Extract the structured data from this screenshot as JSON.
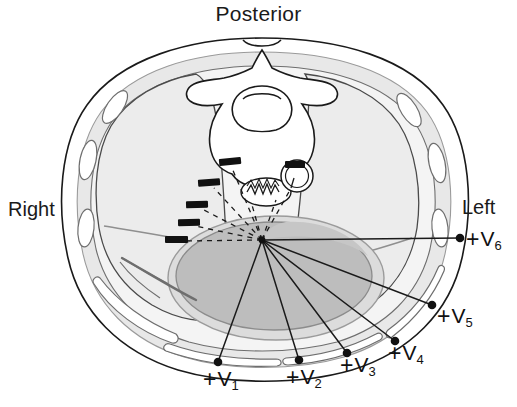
{
  "figure": {
    "kind": "thoracic-cross-section-ecg-precordial-leads",
    "orientation_labels": {
      "top": "Posterior",
      "left": "Right",
      "right": "Left"
    },
    "colors": {
      "outline": "#1a1a1a",
      "soft_tissue_gray": "#cfcfcf",
      "lung_field": "#f2f2f2",
      "heart_fill": "#b9b9b9",
      "pericardium": "#d8d8d8",
      "electrode_dot": "#111111",
      "lead_line": "#1a1a1a",
      "negative_marker": "#111111",
      "text": "#1a1a1a",
      "background": "#ffffff"
    },
    "heart_center": {
      "x": 262,
      "y": 240
    },
    "positive_electrodes": [
      {
        "id": "V1",
        "plus": "+",
        "name": "V",
        "sub": "1",
        "dot_x": 218,
        "dot_y": 362,
        "label_x": 203,
        "label_y": 366
      },
      {
        "id": "V2",
        "plus": "+",
        "name": "V",
        "sub": "2",
        "dot_x": 299,
        "dot_y": 360,
        "label_x": 286,
        "label_y": 364
      },
      {
        "id": "V3",
        "plus": "+",
        "name": "V",
        "sub": "3",
        "dot_x": 347,
        "dot_y": 353,
        "label_x": 340,
        "label_y": 352
      },
      {
        "id": "V4",
        "plus": "+",
        "name": "V",
        "sub": "4",
        "dot_x": 395,
        "dot_y": 341,
        "label_x": 388,
        "label_y": 340
      },
      {
        "id": "V5",
        "plus": "+",
        "name": "V",
        "sub": "5",
        "dot_x": 432,
        "dot_y": 305,
        "label_x": 437,
        "label_y": 305
      },
      {
        "id": "V6",
        "plus": "+",
        "name": "V",
        "sub": "6",
        "dot_x": 460,
        "dot_y": 238,
        "label_x": 466,
        "label_y": 226
      }
    ],
    "negative_markers": [
      {
        "x": 228,
        "y": 163,
        "angle": -6
      },
      {
        "x": 208,
        "y": 183,
        "angle": -4
      },
      {
        "x": 196,
        "y": 205,
        "angle": -2
      },
      {
        "x": 189,
        "y": 222,
        "angle": -1
      },
      {
        "x": 176,
        "y": 240,
        "angle": 0
      },
      {
        "x": 293,
        "y": 165,
        "angle": 0
      }
    ],
    "anatomy_labels": {
      "vertebra": "vertebra",
      "spinal_canal": "spinal-canal",
      "esophagus": "esophagus",
      "descending_aorta": "descending-aorta",
      "right_lung": "right-lung",
      "left_lung": "left-lung",
      "heart": "heart",
      "ribs": "ribs",
      "chest_wall": "chest-wall"
    }
  }
}
